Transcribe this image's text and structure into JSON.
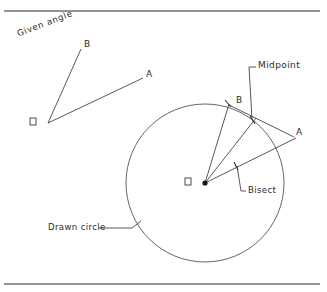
{
  "figure": {
    "background_color": "#ffffff",
    "line_color": "#3a3a3a",
    "frame_color": "#6e6e6e"
  },
  "frame": {
    "top_rule": "horizontal-rule-top",
    "bottom_rule": "horizontal-rule-bottom"
  },
  "left_diagram": {
    "caption": "Given angle",
    "vertex_label": "O",
    "ray_labels": {
      "upper": "B",
      "lower": "A"
    }
  },
  "right_diagram": {
    "vertex_label": "O",
    "point_b_label": "B",
    "point_a_label": "A",
    "midpoint_label": "Midpoint",
    "bisect_label": "Bisect",
    "circle_label": "Drawn circle"
  },
  "geometry": {
    "circle": {
      "cx": 205,
      "cy": 183,
      "r": 79
    },
    "vertex": {
      "x": 205,
      "y": 183
    },
    "point_b": {
      "x": 228,
      "y": 105
    },
    "point_a": {
      "x": 294,
      "y": 137
    },
    "midpoint": {
      "x": 253,
      "y": 121
    },
    "left_vertex": {
      "x": 48,
      "y": 123
    },
    "left_b": {
      "x": 81,
      "y": 49
    },
    "left_a": {
      "x": 143,
      "y": 78
    }
  }
}
